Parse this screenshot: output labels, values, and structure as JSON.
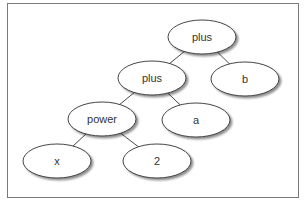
{
  "diagram": {
    "type": "expression-tree",
    "nodes": [
      {
        "id": "n1",
        "label": "plus",
        "cx": 202,
        "cy": 37
      },
      {
        "id": "n2",
        "label": "plus",
        "cx": 152,
        "cy": 78
      },
      {
        "id": "n3",
        "label": "b",
        "cx": 245,
        "cy": 79
      },
      {
        "id": "n4",
        "label": "power",
        "cx": 102,
        "cy": 119
      },
      {
        "id": "n5",
        "label": "a",
        "cx": 196,
        "cy": 120
      },
      {
        "id": "n6",
        "label": "x",
        "cx": 57,
        "cy": 161
      },
      {
        "id": "n7",
        "label": "2",
        "cx": 157,
        "cy": 161
      }
    ],
    "edges": [
      [
        "n1",
        "n2"
      ],
      [
        "n1",
        "n3"
      ],
      [
        "n2",
        "n4"
      ],
      [
        "n2",
        "n5"
      ],
      [
        "n4",
        "n6"
      ],
      [
        "n4",
        "n7"
      ]
    ]
  }
}
